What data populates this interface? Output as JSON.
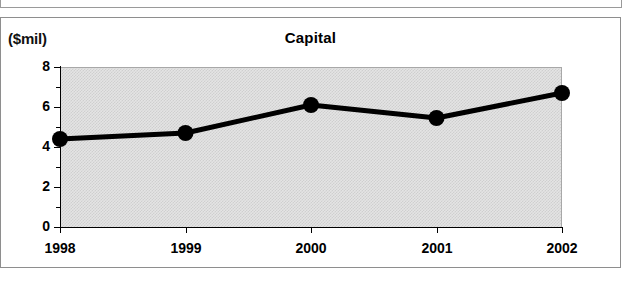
{
  "frame": {
    "top_fragment_present": true
  },
  "chart": {
    "title": "Capital",
    "unit_label": "($mil)"
  },
  "chart_data": {
    "type": "line",
    "title": "Capital",
    "xlabel": "",
    "ylabel": "($mil)",
    "categories": [
      "1998",
      "1999",
      "2000",
      "2001",
      "2002"
    ],
    "values": [
      4.4,
      4.7,
      6.1,
      5.45,
      6.7
    ],
    "series": [
      {
        "name": "Capital",
        "values": [
          4.4,
          4.7,
          6.1,
          5.45,
          6.7
        ]
      }
    ],
    "ylim": [
      0,
      8
    ],
    "ytick_labels": [
      "0",
      "2",
      "4",
      "6",
      "8"
    ],
    "ytick_values": [
      0,
      2,
      4,
      6,
      8
    ],
    "yminor_values": [
      1,
      3,
      5,
      7
    ],
    "grid": false,
    "legend": "none",
    "marker": "filled-circle",
    "line_color": "#000000",
    "marker_color": "#000000",
    "plot_background": "#dcdcdc"
  }
}
